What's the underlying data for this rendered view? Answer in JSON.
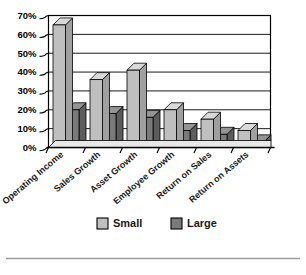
{
  "chart_data": {
    "type": "bar",
    "title": "",
    "subtitle": "",
    "xlabel": "",
    "ylabel": "",
    "ylim": [
      0,
      70
    ],
    "ytick_step": 10,
    "ytick_labels": [
      "0%",
      "10%",
      "20%",
      "30%",
      "40%",
      "50%",
      "60%",
      "70%"
    ],
    "ytick_values": [
      0,
      10,
      20,
      30,
      40,
      50,
      60,
      70
    ],
    "grid": true,
    "grid_axis": "y",
    "legend_position": "bottom",
    "style": "3d-grouped-bars",
    "categories": [
      "Operating Income",
      "Sales Growth",
      "Asset Growth",
      "Employee Growth",
      "Return on Sales",
      "Return on Assets"
    ],
    "series": [
      {
        "name": "Small",
        "color": "#bfbfbf",
        "values": [
          65,
          36,
          41,
          20,
          15,
          9
        ]
      },
      {
        "name": "Large",
        "color": "#7a7a7a",
        "values": [
          20,
          18,
          16,
          9,
          7,
          3
        ]
      }
    ],
    "annotations": []
  },
  "legend": {
    "items": [
      {
        "label": "Small",
        "swatch_color": "#bfbfbf"
      },
      {
        "label": "Large",
        "swatch_color": "#7a7a7a"
      }
    ]
  },
  "colors": {
    "small_face": "#bfbfbf",
    "small_top": "#d9d9d9",
    "small_side": "#a0a0a0",
    "large_face": "#7a7a7a",
    "large_top": "#949494",
    "large_side": "#5c5c5c",
    "axis": "#000000",
    "plot_background": "#ffffff",
    "page_background": "#ffffff",
    "rule": "#9a9a9a"
  }
}
